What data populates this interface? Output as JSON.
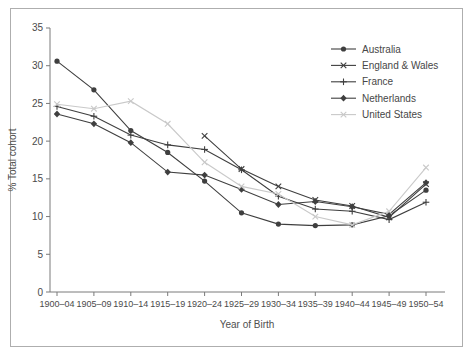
{
  "figure": {
    "xlabel": "Year of Birth",
    "ylabel": "% Total cohort"
  },
  "chart_data": {
    "type": "line",
    "title": "",
    "xlabel": "Year of Birth",
    "ylabel": "% Total cohort",
    "ylim": [
      0,
      35
    ],
    "yticks": [
      0,
      5,
      10,
      15,
      20,
      25,
      30,
      35
    ],
    "grid": false,
    "legend_position": "upper-right-inside",
    "categories": [
      "1900–04",
      "1905–09",
      "1910–14",
      "1915–19",
      "1920–24",
      "1925–29",
      "1930–34",
      "1935–39",
      "1940–44",
      "1945–49",
      "1950–54"
    ],
    "series": [
      {
        "name": "Australia",
        "marker": "circle",
        "color": "#3f3f3f",
        "values": [
          30.6,
          26.8,
          21.4,
          18.5,
          14.7,
          10.5,
          9.0,
          8.8,
          8.9,
          10.1,
          13.5
        ]
      },
      {
        "name": "England & Wales",
        "marker": "x",
        "color": "#3f3f3f",
        "values": [
          null,
          null,
          null,
          null,
          20.7,
          16.3,
          14.0,
          12.2,
          11.4,
          9.9,
          14.3
        ]
      },
      {
        "name": "France",
        "marker": "plus",
        "color": "#3f3f3f",
        "values": [
          24.6,
          23.3,
          20.8,
          19.5,
          18.9,
          16.2,
          12.7,
          11.0,
          10.7,
          9.6,
          11.9
        ]
      },
      {
        "name": "Netherlands",
        "marker": "diamond",
        "color": "#3f3f3f",
        "values": [
          23.6,
          22.3,
          19.8,
          15.9,
          15.5,
          13.6,
          11.6,
          12.0,
          11.3,
          10.3,
          14.5
        ]
      },
      {
        "name": "United States",
        "marker": "x",
        "color": "#c9c9c9",
        "values": [
          24.9,
          24.3,
          25.3,
          22.3,
          17.2,
          14.0,
          13.0,
          10.0,
          8.9,
          10.7,
          16.5
        ]
      }
    ],
    "axis_color": "#7a7a7a",
    "text_color": "#4a4a4a"
  }
}
